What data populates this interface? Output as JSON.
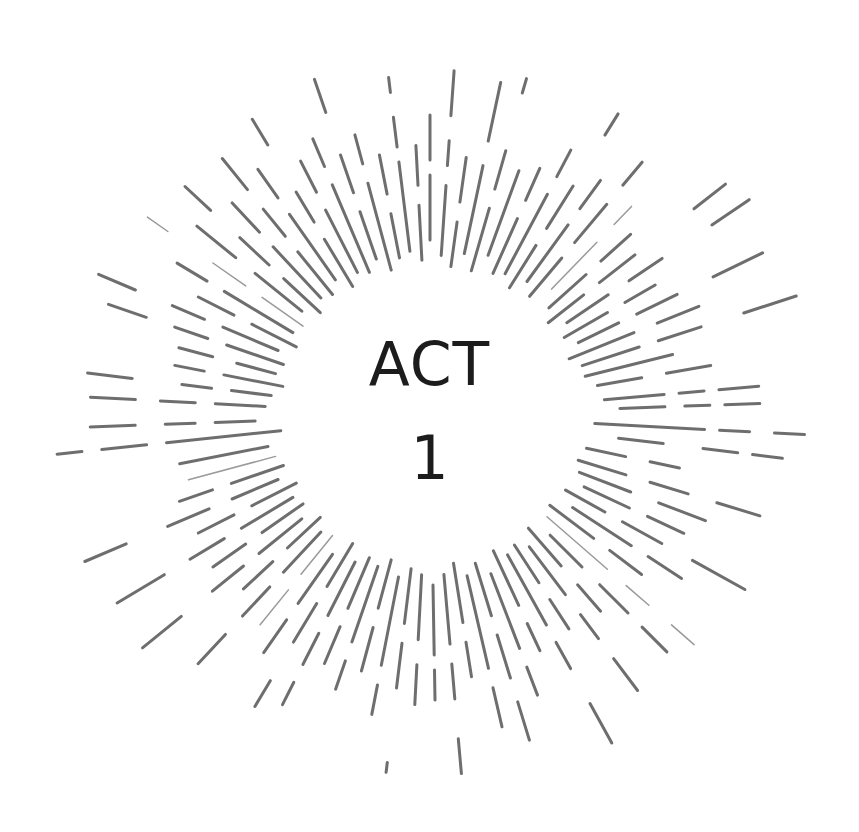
{
  "title": {
    "line1": "ACT",
    "line2": "1"
  },
  "colors": {
    "background": "#ffffff",
    "text": "#1c1c1c",
    "burst_stroke": "#6e6e6e",
    "burst_stroke_light": "#9a9a9a"
  },
  "burst": {
    "center": [
      430,
      415
    ],
    "inner_radius": 150,
    "rays": [
      {
        "angle": -90,
        "segs": [
          [
            175,
            240
          ],
          [
            255,
            300
          ]
        ],
        "w": 3
      },
      {
        "angle": -86,
        "segs": [
          [
            160,
            230
          ],
          [
            250,
            275
          ],
          [
            300,
            345
          ]
        ],
        "w": 3
      },
      {
        "angle": -82,
        "segs": [
          [
            150,
            195
          ],
          [
            215,
            260
          ]
        ],
        "w": 3
      },
      {
        "angle": -78,
        "segs": [
          [
            165,
            255
          ],
          [
            280,
            340
          ]
        ],
        "w": 3
      },
      {
        "angle": -74,
        "segs": [
          [
            150,
            215
          ],
          [
            235,
            275
          ],
          [
            335,
            350
          ]
        ],
        "w": 3
      },
      {
        "angle": -70,
        "segs": [
          [
            170,
            260
          ]
        ],
        "w": 3
      },
      {
        "angle": -66,
        "segs": [
          [
            155,
            215
          ],
          [
            235,
            270
          ]
        ],
        "w": 3
      },
      {
        "angle": -62,
        "segs": [
          [
            160,
            250
          ],
          [
            270,
            300
          ]
        ],
        "w": 3
      },
      {
        "angle": -58,
        "segs": [
          [
            150,
            200
          ],
          [
            220,
            270
          ],
          [
            330,
            355
          ]
        ],
        "w": 3
      },
      {
        "angle": -54,
        "segs": [
          [
            165,
            235
          ],
          [
            255,
            290
          ]
        ],
        "w": 3
      },
      {
        "angle": -50,
        "segs": [
          [
            155,
            205
          ],
          [
            225,
            275
          ],
          [
            300,
            330
          ]
        ],
        "w": 3
      },
      {
        "angle": -46,
        "segs": [
          [
            175,
            240
          ],
          [
            265,
            290
          ]
        ],
        "w": 1.5
      },
      {
        "angle": -42,
        "segs": [
          [
            160,
            210
          ],
          [
            230,
            270
          ]
        ],
        "w": 3
      },
      {
        "angle": -38,
        "segs": [
          [
            150,
            195
          ],
          [
            215,
            260
          ],
          [
            335,
            375
          ]
        ],
        "w": 3
      },
      {
        "angle": -34,
        "segs": [
          [
            165,
            215
          ],
          [
            240,
            280
          ],
          [
            340,
            385
          ]
        ],
        "w": 3
      },
      {
        "angle": -30,
        "segs": [
          [
            155,
            205
          ],
          [
            225,
            260
          ]
        ],
        "w": 3
      },
      {
        "angle": -26,
        "segs": [
          [
            165,
            210
          ],
          [
            230,
            275
          ],
          [
            315,
            370
          ]
        ],
        "w": 3
      },
      {
        "angle": -22,
        "segs": [
          [
            150,
            220
          ],
          [
            245,
            290
          ]
        ],
        "w": 3
      },
      {
        "angle": -18,
        "segs": [
          [
            160,
            220
          ],
          [
            240,
            285
          ],
          [
            330,
            385
          ]
        ],
        "w": 3
      },
      {
        "angle": -14,
        "segs": [
          [
            160,
            250
          ]
        ],
        "w": 3
      },
      {
        "angle": -10,
        "segs": [
          [
            170,
            215
          ],
          [
            240,
            285
          ]
        ],
        "w": 3
      },
      {
        "angle": -5,
        "segs": [
          [
            175,
            235
          ],
          [
            250,
            275
          ],
          [
            290,
            330
          ]
        ],
        "w": 3
      },
      {
        "angle": -2,
        "segs": [
          [
            190,
            235
          ],
          [
            255,
            280
          ],
          [
            295,
            330
          ]
        ],
        "w": 3
      },
      {
        "angle": 3,
        "segs": [
          [
            165,
            275
          ],
          [
            290,
            320
          ],
          [
            345,
            375
          ]
        ],
        "w": 3
      },
      {
        "angle": 7,
        "segs": [
          [
            190,
            235
          ],
          [
            275,
            310
          ],
          [
            325,
            355
          ]
        ],
        "w": 3
      },
      {
        "angle": 12,
        "segs": [
          [
            160,
            200
          ],
          [
            225,
            255
          ]
        ],
        "w": 3
      },
      {
        "angle": 17,
        "segs": [
          [
            155,
            205
          ],
          [
            230,
            270
          ],
          [
            300,
            345
          ]
        ],
        "w": 3
      },
      {
        "angle": 21,
        "segs": [
          [
            160,
            215
          ],
          [
            245,
            295
          ]
        ],
        "w": 3
      },
      {
        "angle": 25,
        "segs": [
          [
            170,
            220
          ],
          [
            240,
            280
          ]
        ],
        "w": 3
      },
      {
        "angle": 29,
        "segs": [
          [
            155,
            200
          ],
          [
            220,
            265
          ],
          [
            300,
            360
          ]
        ],
        "w": 3
      },
      {
        "angle": 33,
        "segs": [
          [
            170,
            240
          ],
          [
            260,
            300
          ]
        ],
        "w": 3
      },
      {
        "angle": 37,
        "segs": [
          [
            150,
            205
          ],
          [
            225,
            265
          ]
        ],
        "w": 3
      },
      {
        "angle": 41,
        "segs": [
          [
            155,
            235
          ],
          [
            260,
            290
          ],
          [
            320,
            350
          ]
        ],
        "w": 1.5
      },
      {
        "angle": 45,
        "segs": [
          [
            170,
            215
          ],
          [
            240,
            280
          ],
          [
            300,
            335
          ]
        ],
        "w": 3
      },
      {
        "angle": 49,
        "segs": [
          [
            150,
            200
          ],
          [
            225,
            260
          ]
        ],
        "w": 3
      },
      {
        "angle": 53,
        "segs": [
          [
            165,
            225
          ],
          [
            250,
            280
          ],
          [
            305,
            345
          ]
        ],
        "w": 3
      },
      {
        "angle": 57,
        "segs": [
          [
            155,
            200
          ],
          [
            220,
            255
          ]
        ],
        "w": 3
      },
      {
        "angle": 61,
        "segs": [
          [
            160,
            240
          ],
          [
            260,
            290
          ],
          [
            330,
            375
          ]
        ],
        "w": 3
      },
      {
        "angle": 65,
        "segs": [
          [
            150,
            210
          ],
          [
            230,
            260
          ]
        ],
        "w": 3
      },
      {
        "angle": 69,
        "segs": [
          [
            170,
            250
          ],
          [
            270,
            300
          ]
        ],
        "w": 3
      },
      {
        "angle": 73,
        "segs": [
          [
            155,
            210
          ],
          [
            230,
            275
          ],
          [
            300,
            340
          ]
        ],
        "w": 3
      },
      {
        "angle": 77,
        "segs": [
          [
            165,
            260
          ],
          [
            280,
            320
          ]
        ],
        "w": 3
      },
      {
        "angle": 81,
        "segs": [
          [
            150,
            210
          ],
          [
            230,
            265
          ]
        ],
        "w": 3
      },
      {
        "angle": 85,
        "segs": [
          [
            160,
            230
          ],
          [
            250,
            285
          ],
          [
            325,
            360
          ]
        ],
        "w": 3
      },
      {
        "angle": 89,
        "segs": [
          [
            170,
            240
          ],
          [
            255,
            285
          ]
        ],
        "w": 3
      },
      {
        "angle": 93,
        "segs": [
          [
            160,
            225
          ],
          [
            250,
            290
          ]
        ],
        "w": 3
      },
      {
        "angle": 97,
        "segs": [
          [
            155,
            210
          ],
          [
            230,
            275
          ],
          [
            350,
            360
          ]
        ],
        "w": 3
      },
      {
        "angle": 101,
        "segs": [
          [
            165,
            255
          ],
          [
            275,
            305
          ]
        ],
        "w": 3
      },
      {
        "angle": 105,
        "segs": [
          [
            150,
            200
          ],
          [
            220,
            265
          ]
        ],
        "w": 3
      },
      {
        "angle": 109,
        "segs": [
          [
            160,
            240
          ],
          [
            260,
            290
          ]
        ],
        "w": 3
      },
      {
        "angle": 113,
        "segs": [
          [
            155,
            210
          ],
          [
            230,
            270
          ]
        ],
        "w": 3
      },
      {
        "angle": 117,
        "segs": [
          [
            165,
            225
          ],
          [
            245,
            280
          ],
          [
            300,
            325
          ]
        ],
        "w": 3
      },
      {
        "angle": 121,
        "segs": [
          [
            150,
            200
          ],
          [
            220,
            265
          ],
          [
            310,
            340
          ]
        ],
        "w": 3
      },
      {
        "angle": 125,
        "segs": [
          [
            170,
            230
          ],
          [
            250,
            290
          ]
        ],
        "w": 3
      },
      {
        "angle": 129,
        "segs": [
          [
            155,
            205
          ],
          [
            225,
            270
          ]
        ],
        "w": 1.5
      },
      {
        "angle": 133,
        "segs": [
          [
            160,
            215
          ],
          [
            235,
            275
          ],
          [
            300,
            340
          ]
        ],
        "w": 3
      },
      {
        "angle": 137,
        "segs": [
          [
            150,
            195
          ],
          [
            215,
            255
          ]
        ],
        "w": 3
      },
      {
        "angle": 141,
        "segs": [
          [
            165,
            220
          ],
          [
            240,
            280
          ],
          [
            320,
            370
          ]
        ],
        "w": 3
      },
      {
        "angle": 145,
        "segs": [
          [
            155,
            205
          ],
          [
            225,
            265
          ]
        ],
        "w": 3
      },
      {
        "angle": 149,
        "segs": [
          [
            160,
            220
          ],
          [
            240,
            280
          ],
          [
            310,
            365
          ]
        ],
        "w": 3
      },
      {
        "angle": 153,
        "segs": [
          [
            150,
            200
          ],
          [
            220,
            260
          ]
        ],
        "w": 3
      },
      {
        "angle": 157,
        "segs": [
          [
            165,
            215
          ],
          [
            240,
            285
          ],
          [
            330,
            375
          ]
        ],
        "w": 3
      },
      {
        "angle": 161,
        "segs": [
          [
            155,
            210
          ],
          [
            230,
            265
          ]
        ],
        "w": 3
      },
      {
        "angle": 165,
        "segs": [
          [
            160,
            250
          ]
        ],
        "w": 1.5
      },
      {
        "angle": 169,
        "segs": [
          [
            165,
            255
          ]
        ],
        "w": 3
      },
      {
        "angle": 174,
        "segs": [
          [
            150,
            265
          ],
          [
            285,
            330
          ],
          [
            350,
            375
          ]
        ],
        "w": 3
      },
      {
        "angle": 178,
        "segs": [
          [
            175,
            215
          ],
          [
            235,
            265
          ],
          [
            295,
            340
          ]
        ],
        "w": 3
      },
      {
        "angle": 183,
        "segs": [
          [
            165,
            215
          ],
          [
            235,
            270
          ],
          [
            295,
            340
          ]
        ],
        "w": 3
      },
      {
        "angle": 187,
        "segs": [
          [
            160,
            200
          ],
          [
            220,
            250
          ],
          [
            300,
            345
          ]
        ],
        "w": 3
      },
      {
        "angle": 191,
        "segs": [
          [
            150,
            210
          ],
          [
            230,
            260
          ]
        ],
        "w": 3
      },
      {
        "angle": 195,
        "segs": [
          [
            160,
            200
          ],
          [
            225,
            260
          ]
        ],
        "w": 3
      },
      {
        "angle": 199,
        "segs": [
          [
            155,
            215
          ],
          [
            235,
            270
          ],
          [
            300,
            340
          ]
        ],
        "w": 3
      },
      {
        "angle": 203,
        "segs": [
          [
            165,
            225
          ],
          [
            245,
            280
          ],
          [
            320,
            360
          ]
        ],
        "w": 3
      },
      {
        "angle": 207,
        "segs": [
          [
            150,
            200
          ],
          [
            220,
            260
          ]
        ],
        "w": 3
      },
      {
        "angle": 211,
        "segs": [
          [
            160,
            240
          ],
          [
            260,
            295
          ]
        ],
        "w": 3
      },
      {
        "angle": 215,
        "segs": [
          [
            155,
            205
          ],
          [
            225,
            265
          ],
          [
            320,
            345
          ]
        ],
        "w": 1.5
      },
      {
        "angle": 219,
        "segs": [
          [
            165,
            225
          ],
          [
            250,
            300
          ]
        ],
        "w": 3
      },
      {
        "angle": 223,
        "segs": [
          [
            150,
            200
          ],
          [
            220,
            260
          ],
          [
            300,
            335
          ]
        ],
        "w": 3
      },
      {
        "angle": 227,
        "segs": [
          [
            160,
            230
          ],
          [
            250,
            290
          ]
        ],
        "w": 3
      },
      {
        "angle": 231,
        "segs": [
          [
            155,
            210
          ],
          [
            230,
            265
          ],
          [
            290,
            330
          ]
        ],
        "w": 3
      },
      {
        "angle": 235,
        "segs": [
          [
            165,
            245
          ],
          [
            265,
            300
          ]
        ],
        "w": 3
      },
      {
        "angle": 239,
        "segs": [
          [
            150,
            205
          ],
          [
            225,
            260
          ],
          [
            315,
            345
          ]
        ],
        "w": 3
      },
      {
        "angle": 243,
        "segs": [
          [
            160,
            230
          ],
          [
            250,
            285
          ]
        ],
        "w": 3
      },
      {
        "angle": 247,
        "segs": [
          [
            155,
            250
          ],
          [
            270,
            300
          ]
        ],
        "w": 3
      },
      {
        "angle": 251,
        "segs": [
          [
            165,
            215
          ],
          [
            235,
            275
          ],
          [
            320,
            355
          ]
        ],
        "w": 3
      },
      {
        "angle": 255,
        "segs": [
          [
            150,
            240
          ],
          [
            260,
            290
          ]
        ],
        "w": 3
      },
      {
        "angle": 259,
        "segs": [
          [
            160,
            205
          ],
          [
            225,
            265
          ]
        ],
        "w": 3
      },
      {
        "angle": 263,
        "segs": [
          [
            165,
            255
          ],
          [
            270,
            300
          ],
          [
            325,
            340
          ]
        ],
        "w": 3
      },
      {
        "angle": 267,
        "segs": [
          [
            155,
            210
          ],
          [
            230,
            270
          ]
        ],
        "w": 3
      }
    ]
  }
}
